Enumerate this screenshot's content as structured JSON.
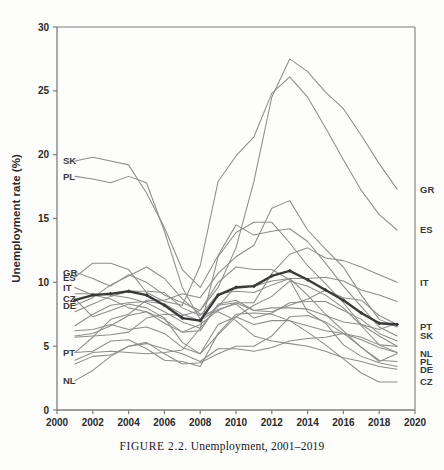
{
  "figure": {
    "caption_label": "FIGURE 2.2.",
    "caption_text": "Unemployment, 2001–2019"
  },
  "chart_data": {
    "type": "line",
    "title": "",
    "xlabel": "",
    "ylabel": "Unemployment rate (%)",
    "xlim": [
      2000,
      2020
    ],
    "ylim": [
      0,
      30
    ],
    "xticks": [
      2000,
      2002,
      2004,
      2006,
      2008,
      2010,
      2012,
      2014,
      2016,
      2018,
      2020
    ],
    "yticks": [
      0,
      5,
      10,
      15,
      20,
      25,
      30
    ],
    "grid": false,
    "legend": "inline-endpoint-labels",
    "x": [
      2001,
      2002,
      2003,
      2004,
      2005,
      2006,
      2007,
      2008,
      2009,
      2010,
      2011,
      2012,
      2013,
      2014,
      2015,
      2016,
      2017,
      2018,
      2019
    ],
    "colors": {
      "series_line": "#8d8d8d",
      "highlight_line": "#3a3a3a",
      "axis": "#7d7d7d",
      "text": "#2b2b2b",
      "background": "#fdfdfb"
    },
    "left_labels": [
      {
        "code": "SK",
        "value": 19.5
      },
      {
        "code": "PL",
        "value": 18.3
      },
      {
        "code": "GR",
        "value": 10.8
      },
      {
        "code": "ES",
        "value": 10.4
      },
      {
        "code": "IT",
        "value": 9.6
      },
      {
        "code": "CZ",
        "value": 8.7
      },
      {
        "code": "DE",
        "value": 8.2
      },
      {
        "code": "PT",
        "value": 4.5
      },
      {
        "code": "NL",
        "value": 2.3
      }
    ],
    "right_labels": [
      {
        "code": "GR",
        "value": 17.3
      },
      {
        "code": "ES",
        "value": 14.1
      },
      {
        "code": "IT",
        "value": 10.0
      },
      {
        "code": "PT",
        "value": 6.5
      },
      {
        "code": "SK",
        "value": 5.8
      },
      {
        "code": "NL",
        "value": 4.4
      },
      {
        "code": "PL",
        "value": 3.8
      },
      {
        "code": "DE",
        "value": 3.2
      },
      {
        "code": "CZ",
        "value": 2.2
      }
    ],
    "series": [
      {
        "name": "GR",
        "highlight": false,
        "values": [
          10.8,
          10.3,
          9.7,
          10.6,
          10.0,
          9.0,
          8.4,
          7.8,
          9.6,
          12.7,
          17.9,
          24.5,
          27.5,
          26.5,
          24.9,
          23.6,
          21.5,
          19.3,
          17.3
        ]
      },
      {
        "name": "ES",
        "highlight": false,
        "values": [
          10.4,
          11.5,
          11.5,
          11.0,
          9.2,
          8.5,
          8.2,
          11.3,
          17.9,
          19.9,
          21.4,
          24.8,
          26.1,
          24.5,
          22.1,
          19.6,
          17.2,
          15.3,
          14.1
        ]
      },
      {
        "name": "IT",
        "highlight": false,
        "values": [
          9.6,
          9.0,
          8.7,
          8.0,
          7.7,
          6.8,
          6.1,
          6.7,
          7.8,
          8.4,
          8.4,
          10.7,
          12.2,
          12.7,
          11.9,
          11.7,
          11.2,
          10.6,
          10.0
        ]
      },
      {
        "name": "CZ",
        "highlight": false,
        "values": [
          8.7,
          7.3,
          7.8,
          8.3,
          8.0,
          7.2,
          5.3,
          4.4,
          6.7,
          7.3,
          6.7,
          7.0,
          7.0,
          6.1,
          5.1,
          4.0,
          2.9,
          2.2,
          2.2
        ]
      },
      {
        "name": "DE",
        "highlight": false,
        "values": [
          8.2,
          8.8,
          9.8,
          10.5,
          11.2,
          10.3,
          8.7,
          7.5,
          7.7,
          7.0,
          5.8,
          5.4,
          5.2,
          5.0,
          4.6,
          4.1,
          3.8,
          3.4,
          3.2
        ]
      },
      {
        "name": "SK",
        "highlight": false,
        "values": [
          19.5,
          19.8,
          19.5,
          19.2,
          17.0,
          14.3,
          11.0,
          9.6,
          12.1,
          14.5,
          13.7,
          14.0,
          14.2,
          13.2,
          11.5,
          9.7,
          8.1,
          6.5,
          5.8
        ]
      },
      {
        "name": "PL",
        "highlight": false,
        "values": [
          18.3,
          18.1,
          17.8,
          18.3,
          17.8,
          14.0,
          9.6,
          7.1,
          8.1,
          9.7,
          9.7,
          10.1,
          10.3,
          9.0,
          7.5,
          6.2,
          4.9,
          3.9,
          3.8
        ]
      },
      {
        "name": "PT",
        "highlight": false,
        "values": [
          4.5,
          5.7,
          7.1,
          7.5,
          8.6,
          8.6,
          9.1,
          8.8,
          10.7,
          12.0,
          12.9,
          15.8,
          16.4,
          14.1,
          12.6,
          11.2,
          9.0,
          7.1,
          6.5
        ]
      },
      {
        "name": "NL",
        "highlight": false,
        "values": [
          2.3,
          3.1,
          4.2,
          5.0,
          5.3,
          4.4,
          3.6,
          3.7,
          4.4,
          5.0,
          5.0,
          5.8,
          7.3,
          7.4,
          6.9,
          6.0,
          4.9,
          3.8,
          4.4
        ]
      },
      {
        "name": "FR",
        "highlight": false,
        "values": [
          7.7,
          8.3,
          8.9,
          9.3,
          9.3,
          9.2,
          8.0,
          7.4,
          9.1,
          9.3,
          9.2,
          9.8,
          10.3,
          10.3,
          10.4,
          10.1,
          9.4,
          9.0,
          8.5
        ]
      },
      {
        "name": "BE",
        "highlight": false,
        "values": [
          6.6,
          7.5,
          8.2,
          8.4,
          8.5,
          8.3,
          7.5,
          7.0,
          7.9,
          8.3,
          7.2,
          7.6,
          8.4,
          8.5,
          8.5,
          7.8,
          7.1,
          6.0,
          5.4
        ]
      },
      {
        "name": "AT",
        "highlight": false,
        "values": [
          3.6,
          4.2,
          4.3,
          5.0,
          5.2,
          4.8,
          4.4,
          3.8,
          4.8,
          4.8,
          4.6,
          4.9,
          5.4,
          5.6,
          5.7,
          6.0,
          5.5,
          4.9,
          4.5
        ]
      },
      {
        "name": "FI",
        "highlight": false,
        "values": [
          9.1,
          9.1,
          9.0,
          8.8,
          8.4,
          7.7,
          6.9,
          6.4,
          8.2,
          8.4,
          7.8,
          7.7,
          8.2,
          8.7,
          9.4,
          8.8,
          8.6,
          7.4,
          6.7
        ]
      },
      {
        "name": "SE",
        "highlight": false,
        "values": [
          5.8,
          6.0,
          6.6,
          7.4,
          7.7,
          7.1,
          6.1,
          6.2,
          8.3,
          8.6,
          7.8,
          8.0,
          8.0,
          7.9,
          7.4,
          6.9,
          6.7,
          6.3,
          6.8
        ]
      },
      {
        "name": "DK",
        "highlight": false,
        "values": [
          4.5,
          4.6,
          5.4,
          5.5,
          4.8,
          3.9,
          3.8,
          3.4,
          6.0,
          7.5,
          7.6,
          7.5,
          7.0,
          6.6,
          6.2,
          6.0,
          5.7,
          5.1,
          5.0
        ]
      },
      {
        "name": "IE",
        "highlight": false,
        "values": [
          3.9,
          4.5,
          4.6,
          4.5,
          4.4,
          4.5,
          4.7,
          6.4,
          12.0,
          13.9,
          14.7,
          14.7,
          13.1,
          11.3,
          9.9,
          8.4,
          6.7,
          5.8,
          5.0
        ]
      },
      {
        "name": "SI",
        "highlight": false,
        "values": [
          6.2,
          6.3,
          6.7,
          6.3,
          6.5,
          6.0,
          4.9,
          4.4,
          5.9,
          7.3,
          8.2,
          8.9,
          10.1,
          9.7,
          9.0,
          8.0,
          6.6,
          5.1,
          4.5
        ]
      },
      {
        "name": "HU",
        "highlight": false,
        "values": [
          5.7,
          5.8,
          5.9,
          6.1,
          7.2,
          7.5,
          7.4,
          7.8,
          10.0,
          11.2,
          11.0,
          11.0,
          10.2,
          7.7,
          6.8,
          5.1,
          4.2,
          3.7,
          3.4
        ]
      },
      {
        "name": "EU-average",
        "highlight": true,
        "values": [
          8.6,
          9.0,
          9.1,
          9.3,
          9.0,
          8.2,
          7.2,
          7.0,
          9.0,
          9.6,
          9.7,
          10.5,
          10.9,
          10.2,
          9.4,
          8.6,
          7.6,
          6.8,
          6.7
        ]
      }
    ]
  }
}
